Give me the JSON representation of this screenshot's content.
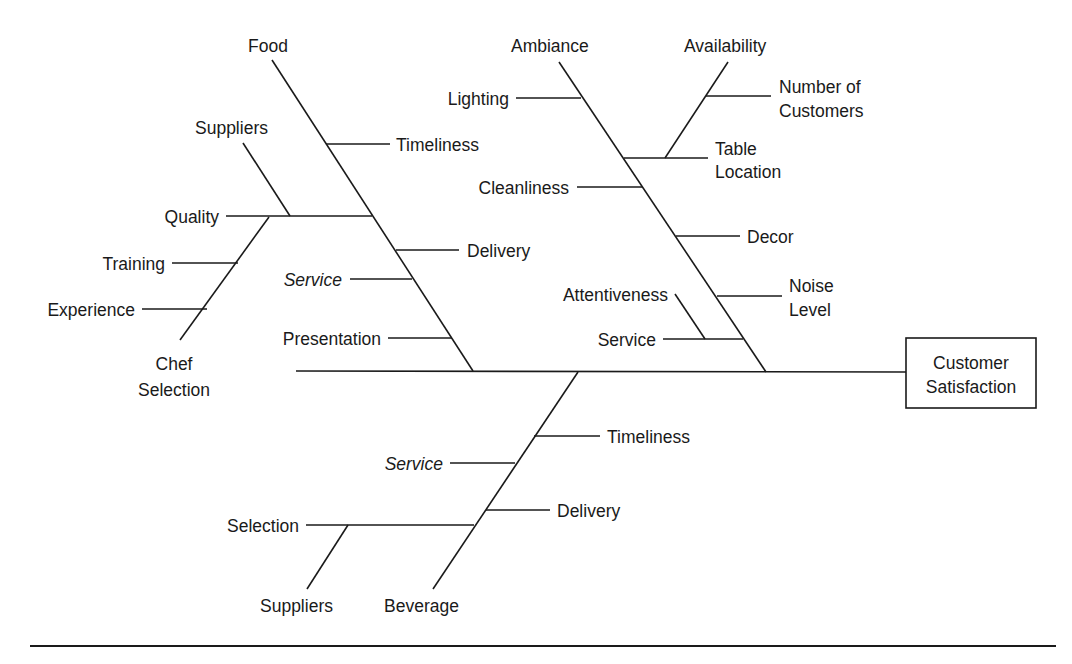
{
  "diagram": {
    "type": "fishbone",
    "effect": {
      "line1": "Customer",
      "line2": "Satisfaction"
    },
    "categories": {
      "food": {
        "label": "Food",
        "causes": {
          "timeliness": "Timeliness",
          "delivery": "Delivery",
          "service": "Service",
          "presentation": "Presentation",
          "quality": "Quality",
          "quality_sub": {
            "suppliers": "Suppliers",
            "training": "Training",
            "experience": "Experience",
            "chef_line1": "Chef",
            "chef_line2": "Selection"
          }
        }
      },
      "ambiance": {
        "label": "Ambiance",
        "causes": {
          "lighting": "Lighting",
          "cleanliness": "Cleanliness",
          "decor": "Decor",
          "noise_line1": "Noise",
          "noise_line2": "Level",
          "service": "Service",
          "attentiveness": "Attentiveness"
        }
      },
      "availability": {
        "label": "Availability",
        "causes": {
          "customers_line1": "Number of",
          "customers_line2": "Customers",
          "table_line1": "Table",
          "table_line2": "Location"
        }
      },
      "beverage": {
        "label": "Beverage",
        "causes": {
          "timeliness": "Timeliness",
          "service": "Service",
          "delivery": "Delivery",
          "selection": "Selection",
          "suppliers": "Suppliers"
        }
      }
    }
  }
}
